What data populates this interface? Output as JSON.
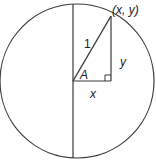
{
  "diagram": {
    "type": "unit-circle-right-triangle",
    "labels": {
      "point": "(x, y)",
      "hypotenuse": "1",
      "vertical_leg": "y",
      "horizontal_leg": "x",
      "angle": "A"
    },
    "colors": {
      "line": "#3a3a3a",
      "text": "#222222",
      "background": "#ffffff"
    }
  }
}
